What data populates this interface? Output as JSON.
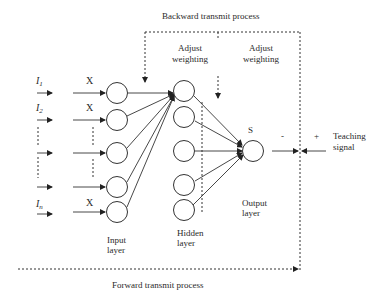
{
  "labels": {
    "backward": "Backward transmit process",
    "forward": "Forward transmit process",
    "adjust1_l1": "Adjust",
    "adjust1_l2": "weighting",
    "adjust2_l1": "Adjust",
    "adjust2_l2": "weighting",
    "input_l1": "Input",
    "input_l2": "layer",
    "hidden_l1": "Hidden",
    "hidden_l2": "layer",
    "output_l1": "Output",
    "output_l2": "layer",
    "output_node": "S",
    "minus": "-",
    "plus": "+",
    "teaching_l1": "Teaching",
    "teaching_l2": "signal",
    "weight_x": "X",
    "i1": "I",
    "i1_sub": "1",
    "i2": "I",
    "i2_sub": "2",
    "in": "I",
    "in_sub": "n"
  },
  "layers": {
    "input": {
      "nodes": 5,
      "x": 117,
      "y": [
        93,
        120,
        153,
        187,
        212
      ]
    },
    "hidden": {
      "nodes": 5,
      "x": 185,
      "y": [
        91,
        117,
        151,
        185,
        210
      ]
    },
    "output": {
      "nodes": 1,
      "x": 253,
      "y": [
        151
      ]
    }
  }
}
